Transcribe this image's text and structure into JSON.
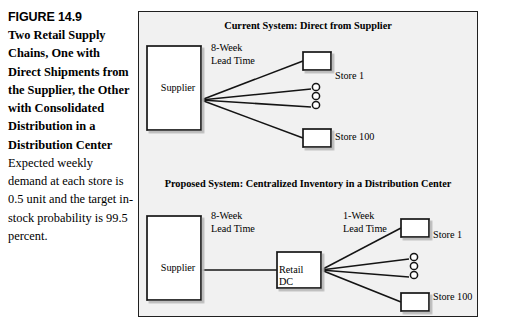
{
  "caption": {
    "figure_number": "FIGURE 14.9",
    "title": "Two Retail Supply Chains, One with Direct Shipments from the Supplier, the Other with Consolidated Distribution in a Distribution Center",
    "description": "Expected weekly demand at each store is 0.5 unit and the target in-stock probability is 99.5 percent."
  },
  "diagram": {
    "panel_background": "#f1f1f1",
    "border_color": "#202020",
    "sections": [
      {
        "id": "current",
        "title": "Current System: Direct from Supplier",
        "lead_times": [
          {
            "id": "supplier-to-store",
            "line1": "8-Week",
            "line2": "Lead Time"
          }
        ],
        "nodes": [
          {
            "id": "supplier",
            "label": "Supplier"
          },
          {
            "id": "store-1",
            "label": "Store 1"
          },
          {
            "id": "store-100",
            "label": "Store 100"
          }
        ],
        "ellipsis": "three-circles"
      },
      {
        "id": "proposed",
        "title": "Proposed System: Centralized Inventory in a Distribution Center",
        "lead_times": [
          {
            "id": "supplier-to-dc",
            "line1": "8-Week",
            "line2": "Lead Time"
          },
          {
            "id": "dc-to-store",
            "line1": "1-Week",
            "line2": "Lead Time"
          }
        ],
        "nodes": [
          {
            "id": "supplier",
            "label": "Supplier"
          },
          {
            "id": "retail-dc",
            "label_line1": "Retail",
            "label_line2": "DC"
          },
          {
            "id": "store-1",
            "label": "Store 1"
          },
          {
            "id": "store-100",
            "label": "Store 100"
          }
        ],
        "ellipsis": "three-circles"
      }
    ]
  }
}
